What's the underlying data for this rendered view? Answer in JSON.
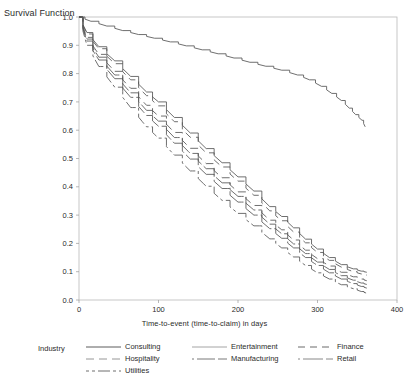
{
  "axes": {
    "y_title": "Survival Function",
    "x_title": "Time-to-event (time-to-claim) in days",
    "y_ticks": [
      "0.0",
      "0.1",
      "0.2",
      "0.3",
      "0.4",
      "0.5",
      "0.6",
      "0.7",
      "0.8",
      "0.9",
      "1.0"
    ],
    "x_ticks": [
      "0",
      "100",
      "200",
      "300",
      "400"
    ]
  },
  "legend": {
    "title": "Industry",
    "entries": [
      {
        "label": "Consulting",
        "dash": "none",
        "color": "#4a4a4a"
      },
      {
        "label": "Entertainment",
        "dash": "none",
        "color": "#9a9a9a"
      },
      {
        "label": "Finance",
        "dash": "7,5",
        "color": "#5a5a5a"
      },
      {
        "label": "Hospitality",
        "dash": "8,5",
        "color": "#8a8a8a"
      },
      {
        "label": "Manufacturing",
        "dash": "2,3,16,0",
        "color": "#6a6a6a"
      },
      {
        "label": "Retail",
        "dash": "2,3,18,0",
        "color": "#7a7a7a"
      },
      {
        "label": "Utilities",
        "dash": "3,3,3,3,9,0",
        "color": "#5f5f5f"
      }
    ]
  },
  "chart_data": {
    "type": "line",
    "title": "",
    "xlabel": "Time-to-event (time-to-claim) in days",
    "ylabel": "Survival Function",
    "xlim": [
      0,
      400
    ],
    "ylim": [
      0.0,
      1.0
    ],
    "grid": false,
    "legend_position": "bottom",
    "series": [
      {
        "name": "Consulting",
        "dash": "none",
        "color": "#4a4a4a",
        "x": [
          0,
          15,
          35,
          55,
          75,
          95,
          115,
          135,
          155,
          175,
          195,
          215,
          235,
          255,
          275,
          290,
          305,
          318,
          330,
          340,
          348,
          356,
          360
        ],
        "y": [
          1.0,
          0.985,
          0.968,
          0.952,
          0.938,
          0.925,
          0.912,
          0.898,
          0.884,
          0.87,
          0.855,
          0.84,
          0.826,
          0.812,
          0.795,
          0.778,
          0.755,
          0.73,
          0.705,
          0.678,
          0.655,
          0.635,
          0.612
        ]
      },
      {
        "name": "Entertainment",
        "dash": "none",
        "color": "#9a9a9a",
        "x": [
          0,
          10,
          25,
          45,
          65,
          85,
          100,
          120,
          140,
          160,
          180,
          200,
          220,
          240,
          255,
          270,
          285,
          300,
          315,
          330,
          345,
          355,
          362
        ],
        "y": [
          1.0,
          0.945,
          0.895,
          0.845,
          0.79,
          0.735,
          0.7,
          0.645,
          0.59,
          0.535,
          0.485,
          0.435,
          0.385,
          0.33,
          0.295,
          0.255,
          0.215,
          0.18,
          0.15,
          0.125,
          0.11,
          0.102,
          0.098
        ]
      },
      {
        "name": "Finance",
        "dash": "7,5",
        "color": "#5a5a5a",
        "x": [
          0,
          10,
          25,
          45,
          65,
          85,
          100,
          120,
          140,
          160,
          180,
          200,
          220,
          240,
          255,
          270,
          285,
          300,
          315,
          330,
          345,
          355,
          362
        ],
        "y": [
          1.0,
          0.94,
          0.888,
          0.835,
          0.778,
          0.722,
          0.686,
          0.63,
          0.575,
          0.52,
          0.47,
          0.42,
          0.37,
          0.315,
          0.28,
          0.24,
          0.202,
          0.168,
          0.14,
          0.116,
          0.1,
          0.092,
          0.088
        ]
      },
      {
        "name": "Hospitality",
        "dash": "8,5",
        "color": "#8a8a8a",
        "x": [
          0,
          10,
          25,
          45,
          65,
          85,
          100,
          120,
          140,
          160,
          180,
          200,
          220,
          240,
          255,
          270,
          285,
          300,
          315,
          330,
          345,
          355,
          362
        ],
        "y": [
          1.0,
          0.928,
          0.868,
          0.808,
          0.748,
          0.688,
          0.65,
          0.592,
          0.536,
          0.482,
          0.432,
          0.382,
          0.334,
          0.282,
          0.248,
          0.212,
          0.176,
          0.146,
          0.12,
          0.098,
          0.082,
          0.074,
          0.068
        ]
      },
      {
        "name": "Manufacturing",
        "dash": "2,3,16,0",
        "color": "#6a6a6a",
        "x": [
          0,
          10,
          25,
          45,
          65,
          85,
          100,
          120,
          140,
          160,
          180,
          200,
          220,
          240,
          255,
          270,
          285,
          300,
          315,
          330,
          345,
          355,
          362
        ],
        "y": [
          1.0,
          0.922,
          0.858,
          0.795,
          0.732,
          0.67,
          0.632,
          0.574,
          0.518,
          0.464,
          0.414,
          0.366,
          0.318,
          0.268,
          0.234,
          0.198,
          0.164,
          0.134,
          0.108,
          0.086,
          0.07,
          0.06,
          0.055
        ]
      },
      {
        "name": "Retail",
        "dash": "2,3,18,0",
        "color": "#7a7a7a",
        "x": [
          0,
          10,
          25,
          45,
          65,
          85,
          100,
          120,
          140,
          160,
          180,
          200,
          220,
          240,
          255,
          270,
          285,
          300,
          315,
          330,
          345,
          355,
          362
        ],
        "y": [
          1.0,
          0.915,
          0.848,
          0.782,
          0.716,
          0.652,
          0.614,
          0.554,
          0.498,
          0.444,
          0.394,
          0.346,
          0.3,
          0.252,
          0.218,
          0.184,
          0.15,
          0.122,
          0.096,
          0.074,
          0.058,
          0.048,
          0.042
        ]
      },
      {
        "name": "Utilities",
        "dash": "3,3,3,3,9,0",
        "color": "#5f5f5f",
        "x": [
          0,
          10,
          25,
          45,
          65,
          85,
          100,
          120,
          140,
          160,
          180,
          200,
          220,
          240,
          255,
          270,
          285,
          300,
          315,
          330,
          345,
          355,
          362
        ],
        "y": [
          1.0,
          0.9,
          0.825,
          0.752,
          0.68,
          0.612,
          0.572,
          0.512,
          0.456,
          0.402,
          0.352,
          0.306,
          0.262,
          0.216,
          0.184,
          0.152,
          0.122,
          0.096,
          0.074,
          0.054,
          0.04,
          0.03,
          0.024
        ]
      }
    ]
  }
}
